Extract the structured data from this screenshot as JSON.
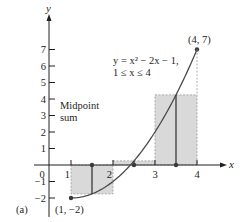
{
  "chart_data": {
    "type": "line",
    "title": "",
    "panel_label": "(a)",
    "xlabel": "x",
    "ylabel": "y",
    "xlim": [
      0,
      4.6
    ],
    "ylim": [
      -3,
      8
    ],
    "grid": false,
    "x_ticks": [
      0,
      1,
      2,
      3,
      4
    ],
    "x_tick_labels": [
      "0",
      "1",
      "2",
      "3",
      "4"
    ],
    "y_ticks": [
      -2,
      -1,
      1,
      2,
      3,
      4,
      5,
      6,
      7
    ],
    "y_tick_labels": [
      "-2",
      "-1",
      "1",
      "2",
      "3",
      "4",
      "5",
      "6",
      "7"
    ],
    "curve": {
      "equation_line1": "y = x² − 2x − 1,",
      "equation_line2": "1 ≤ x ≤ 4",
      "domain": [
        1,
        4
      ],
      "x": [
        1.0,
        1.5,
        2.0,
        2.5,
        3.0,
        3.5,
        4.0
      ],
      "y": [
        -2.0,
        -1.75,
        -1.0,
        0.25,
        2.0,
        4.25,
        7.0
      ]
    },
    "endpoints": [
      {
        "label": "(1, −2)",
        "x": 1,
        "y": -2
      },
      {
        "label": "(4, 7)",
        "x": 4,
        "y": 7
      }
    ],
    "annotation": {
      "line1": "Midpoint",
      "line2": "sum"
    },
    "rectangles": [
      {
        "x0": 1,
        "x1": 2,
        "midpoint": 1.5,
        "height": -1.75
      },
      {
        "x0": 2,
        "x1": 3,
        "midpoint": 2.5,
        "height": 0.25
      },
      {
        "x0": 3,
        "x1": 4,
        "midpoint": 3.5,
        "height": 4.25
      }
    ],
    "colors": {
      "axis": "#231f20",
      "curve": "#4a4a4a",
      "rect_fill": "#d9d9d9",
      "rect_stroke": "#9a9a9a"
    }
  }
}
